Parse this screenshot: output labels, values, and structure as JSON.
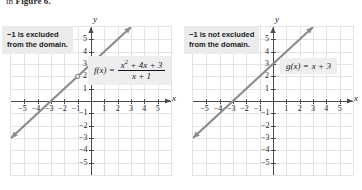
{
  "caption": {
    "prefix": "in ",
    "bold": "Figure 6.",
    "full": "in Figure 6."
  },
  "chart_data": [
    {
      "id": "left",
      "type": "line",
      "title": "",
      "function_label": "f(x) =",
      "numerator": "x² + 4x + 3",
      "denominator": "x + 1",
      "expression": "f(x) = (x^2 + 4x + 3)/(x + 1)",
      "annotation": "−1 is excluded\nfrom the domain.",
      "annotation_line1": "−1 is excluded",
      "annotation_line2": "from the domain.",
      "xlabel": "x",
      "ylabel": "y",
      "xlim": [
        -6,
        6
      ],
      "ylim": [
        -6,
        6
      ],
      "xticks": [
        -5,
        -4,
        -3,
        -2,
        -1,
        1,
        2,
        3,
        4,
        5
      ],
      "yticks": [
        -5,
        -4,
        -3,
        -2,
        -1,
        1,
        2,
        3,
        4,
        5
      ],
      "xticklabels": [
        "-5",
        "-4",
        "-3",
        "-2",
        "-1",
        "1",
        "2",
        "3",
        "4",
        "5"
      ],
      "yticklabels": [
        "-5",
        "-4",
        "-3",
        "-2",
        "-1",
        "1",
        "2",
        "3",
        "4",
        "5"
      ],
      "grid": true,
      "slope": 1,
      "intercept": 3,
      "line_points": [
        [
          -6,
          -3
        ],
        [
          6,
          9
        ]
      ],
      "excluded_point": [
        -1,
        2
      ],
      "has_hole": true
    },
    {
      "id": "right",
      "type": "line",
      "title": "",
      "function_label": "g(x) =",
      "expression": "g(x) = x + 3",
      "expression_rhs": "x + 3",
      "annotation": "−1 is not excluded\nfrom the domain.",
      "annotation_line1": "−1 is not excluded",
      "annotation_line2": "from the domain.",
      "xlabel": "x",
      "ylabel": "y",
      "xlim": [
        -6,
        6
      ],
      "ylim": [
        -6,
        6
      ],
      "xticks": [
        -5,
        -4,
        -3,
        -2,
        -1,
        1,
        2,
        3,
        4,
        5
      ],
      "yticks": [
        -5,
        -4,
        -3,
        -2,
        -1,
        1,
        2,
        3,
        4,
        5
      ],
      "xticklabels": [
        "-5",
        "-4",
        "-3",
        "-2",
        "-1",
        "1",
        "2",
        "3",
        "4",
        "5"
      ],
      "yticklabels": [
        "-5",
        "-4",
        "-3",
        "-2",
        "-1",
        "1",
        "2",
        "3",
        "4",
        "5"
      ],
      "grid": true,
      "slope": 1,
      "intercept": 3,
      "line_points": [
        [
          -6,
          -3
        ],
        [
          6,
          9
        ]
      ],
      "excluded_point": null,
      "has_hole": false
    }
  ],
  "colors": {
    "line": "#8c8c8c",
    "grid": "#dfe3ea",
    "axis": "#4a4a4a",
    "note_bg": "#ebebeb",
    "formula_bg": "#eeeeee",
    "text": "#1c1c1c"
  }
}
